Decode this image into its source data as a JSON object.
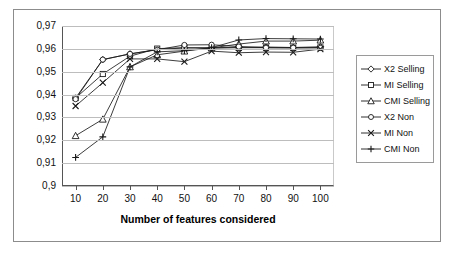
{
  "figure": {
    "decimal_separator": "comma"
  },
  "chart_data": {
    "type": "line",
    "title": "",
    "subtitle": "",
    "xlabel": "Number of features considered",
    "ylabel": "",
    "x": [
      10,
      20,
      30,
      40,
      50,
      60,
      70,
      80,
      90,
      100
    ],
    "xtick_labels": [
      "10",
      "20",
      "30",
      "40",
      "50",
      "60",
      "70",
      "80",
      "90",
      "100"
    ],
    "ytick_labels": [
      "0,97",
      "0,96",
      "0,95",
      "0,94",
      "0,93",
      "0,92",
      "0,91",
      "0,9"
    ],
    "ytick_values": [
      0.97,
      0.96,
      0.95,
      0.94,
      0.93,
      0.92,
      0.91,
      0.9
    ],
    "xlim": [
      5,
      105
    ],
    "ylim": [
      0.9,
      0.97
    ],
    "grid": true,
    "grid_axis": "y",
    "legend_position": "right",
    "line_color": "#1a1a1a",
    "grid_color": "#bdbdbd",
    "series": [
      {
        "name": "X2 Selling",
        "marker": "diamond",
        "values": [
          0.9385,
          0.9553,
          0.9578,
          0.9597,
          0.9604,
          0.9605,
          0.9607,
          0.9608,
          0.9606,
          0.9609
        ]
      },
      {
        "name": "MI Selling",
        "marker": "square",
        "values": [
          0.9385,
          0.949,
          0.9568,
          0.9601,
          0.9605,
          0.9603,
          0.9605,
          0.9605,
          0.9604,
          0.9606
        ]
      },
      {
        "name": "CMI Selling",
        "marker": "triangle",
        "values": [
          0.922,
          0.9292,
          0.9521,
          0.9574,
          0.959,
          0.9604,
          0.9621,
          0.9634,
          0.9634,
          0.9638
        ]
      },
      {
        "name": "X2 Non",
        "marker": "circle",
        "values": [
          0.938,
          0.9553,
          0.9578,
          0.9596,
          0.9617,
          0.9618,
          0.961,
          0.9605,
          0.9605,
          0.9604
        ]
      },
      {
        "name": "MI Non",
        "marker": "x",
        "values": [
          0.935,
          0.9452,
          0.9556,
          0.9556,
          0.9544,
          0.959,
          0.9583,
          0.9586,
          0.9585,
          0.9599
        ]
      },
      {
        "name": "CMI Non",
        "marker": "plus",
        "values": [
          0.9125,
          0.9215,
          0.9521,
          0.9587,
          0.9592,
          0.9605,
          0.9639,
          0.9645,
          0.9644,
          0.9643
        ]
      }
    ]
  }
}
